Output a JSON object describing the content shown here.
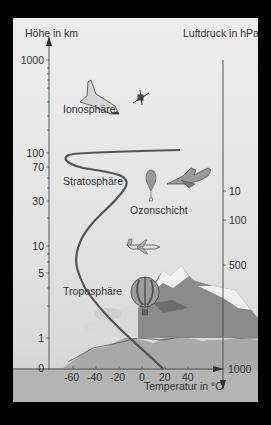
{
  "diagram": {
    "left_axis": {
      "title": "Höhe in km",
      "ticks": [
        {
          "label": "1000",
          "y": 42
        },
        {
          "label": "100",
          "y": 135
        },
        {
          "label": "70",
          "y": 149
        },
        {
          "label": "30",
          "y": 183
        },
        {
          "label": "10",
          "y": 228
        },
        {
          "label": "5",
          "y": 255
        },
        {
          "label": "1",
          "y": 320
        },
        {
          "label": "0",
          "y": 350
        }
      ]
    },
    "right_axis": {
      "title": "Luftdruck in hPa",
      "ticks": [
        {
          "label": "10",
          "y": 173
        },
        {
          "label": "100",
          "y": 202
        },
        {
          "label": "500",
          "y": 247
        },
        {
          "label": "1000",
          "y": 351
        }
      ]
    },
    "bottom_axis": {
      "title": "Temperatur in °C",
      "ticks": [
        "-60",
        "-40",
        "-20",
        "0",
        "20",
        "40"
      ]
    },
    "layers": {
      "ionosphere": "Ionosphäre",
      "stratosphere": "Stratosphäre",
      "ozone": "Ozonschicht",
      "troposphere": "Troposphäre"
    },
    "pictograms": [
      "space-shuttle",
      "satellite",
      "weather-balloon",
      "fighter-jet",
      "airliner",
      "hot-air-balloon",
      "mountains",
      "clouds"
    ],
    "colors": {
      "curve": "#555555",
      "axis": "#555555",
      "text": "#333333",
      "ground": "#a8a8a8"
    }
  }
}
